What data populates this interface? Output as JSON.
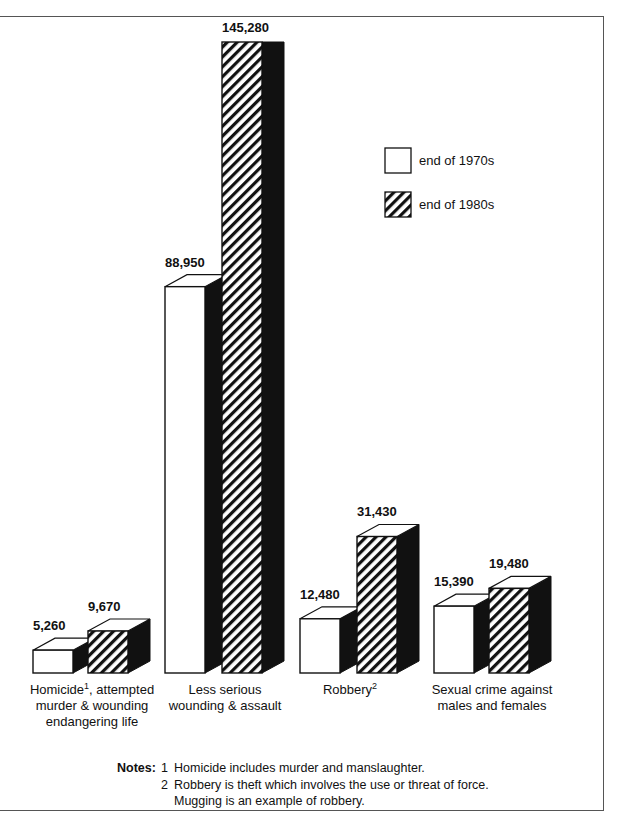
{
  "chart_data": {
    "type": "bar",
    "style": "3d-grouped",
    "title": "",
    "xlabel": "",
    "ylabel": "",
    "categories": [
      "Homicide¹, attempted murder & wounding endangering life",
      "Less serious wounding & assault",
      "Robbery²",
      "Sexual crime against males and females"
    ],
    "category_lines": [
      [
        "Homicide",
        "1",
        ", attempted",
        "murder & wounding",
        "endangering life"
      ],
      [
        "Less serious",
        "wounding & assault"
      ],
      [
        "Robbery",
        "2"
      ],
      [
        "Sexual crime against",
        "males and females"
      ]
    ],
    "series": [
      {
        "name": "end of 1970s",
        "pattern": "plain",
        "values": [
          5260,
          88950,
          12480,
          15390
        ],
        "labels": [
          "5,260",
          "88,950",
          "12,480",
          "15,390"
        ]
      },
      {
        "name": "end of 1980s",
        "pattern": "hatched",
        "values": [
          9670,
          145280,
          31430,
          19480
        ],
        "labels": [
          "9,670",
          "145,280",
          "31,430",
          "19,480"
        ]
      }
    ],
    "axes_visible": false,
    "grid": false,
    "legend_position": "upper right"
  },
  "legend": {
    "items": [
      {
        "label": "end of 1970s",
        "pattern": "plain"
      },
      {
        "label": "end of 1980s",
        "pattern": "hatched"
      }
    ]
  },
  "notes": {
    "label": "Notes:",
    "items": [
      {
        "num": "1",
        "text": "Homicide includes murder and manslaughter."
      },
      {
        "num": "2",
        "text": "Robbery is theft which involves the use or threat of force."
      },
      {
        "num": "",
        "text": "Mugging is an example of robbery."
      }
    ]
  },
  "colors": {
    "ink": "#111111",
    "paper": "#ffffff",
    "frame": "#555555"
  }
}
